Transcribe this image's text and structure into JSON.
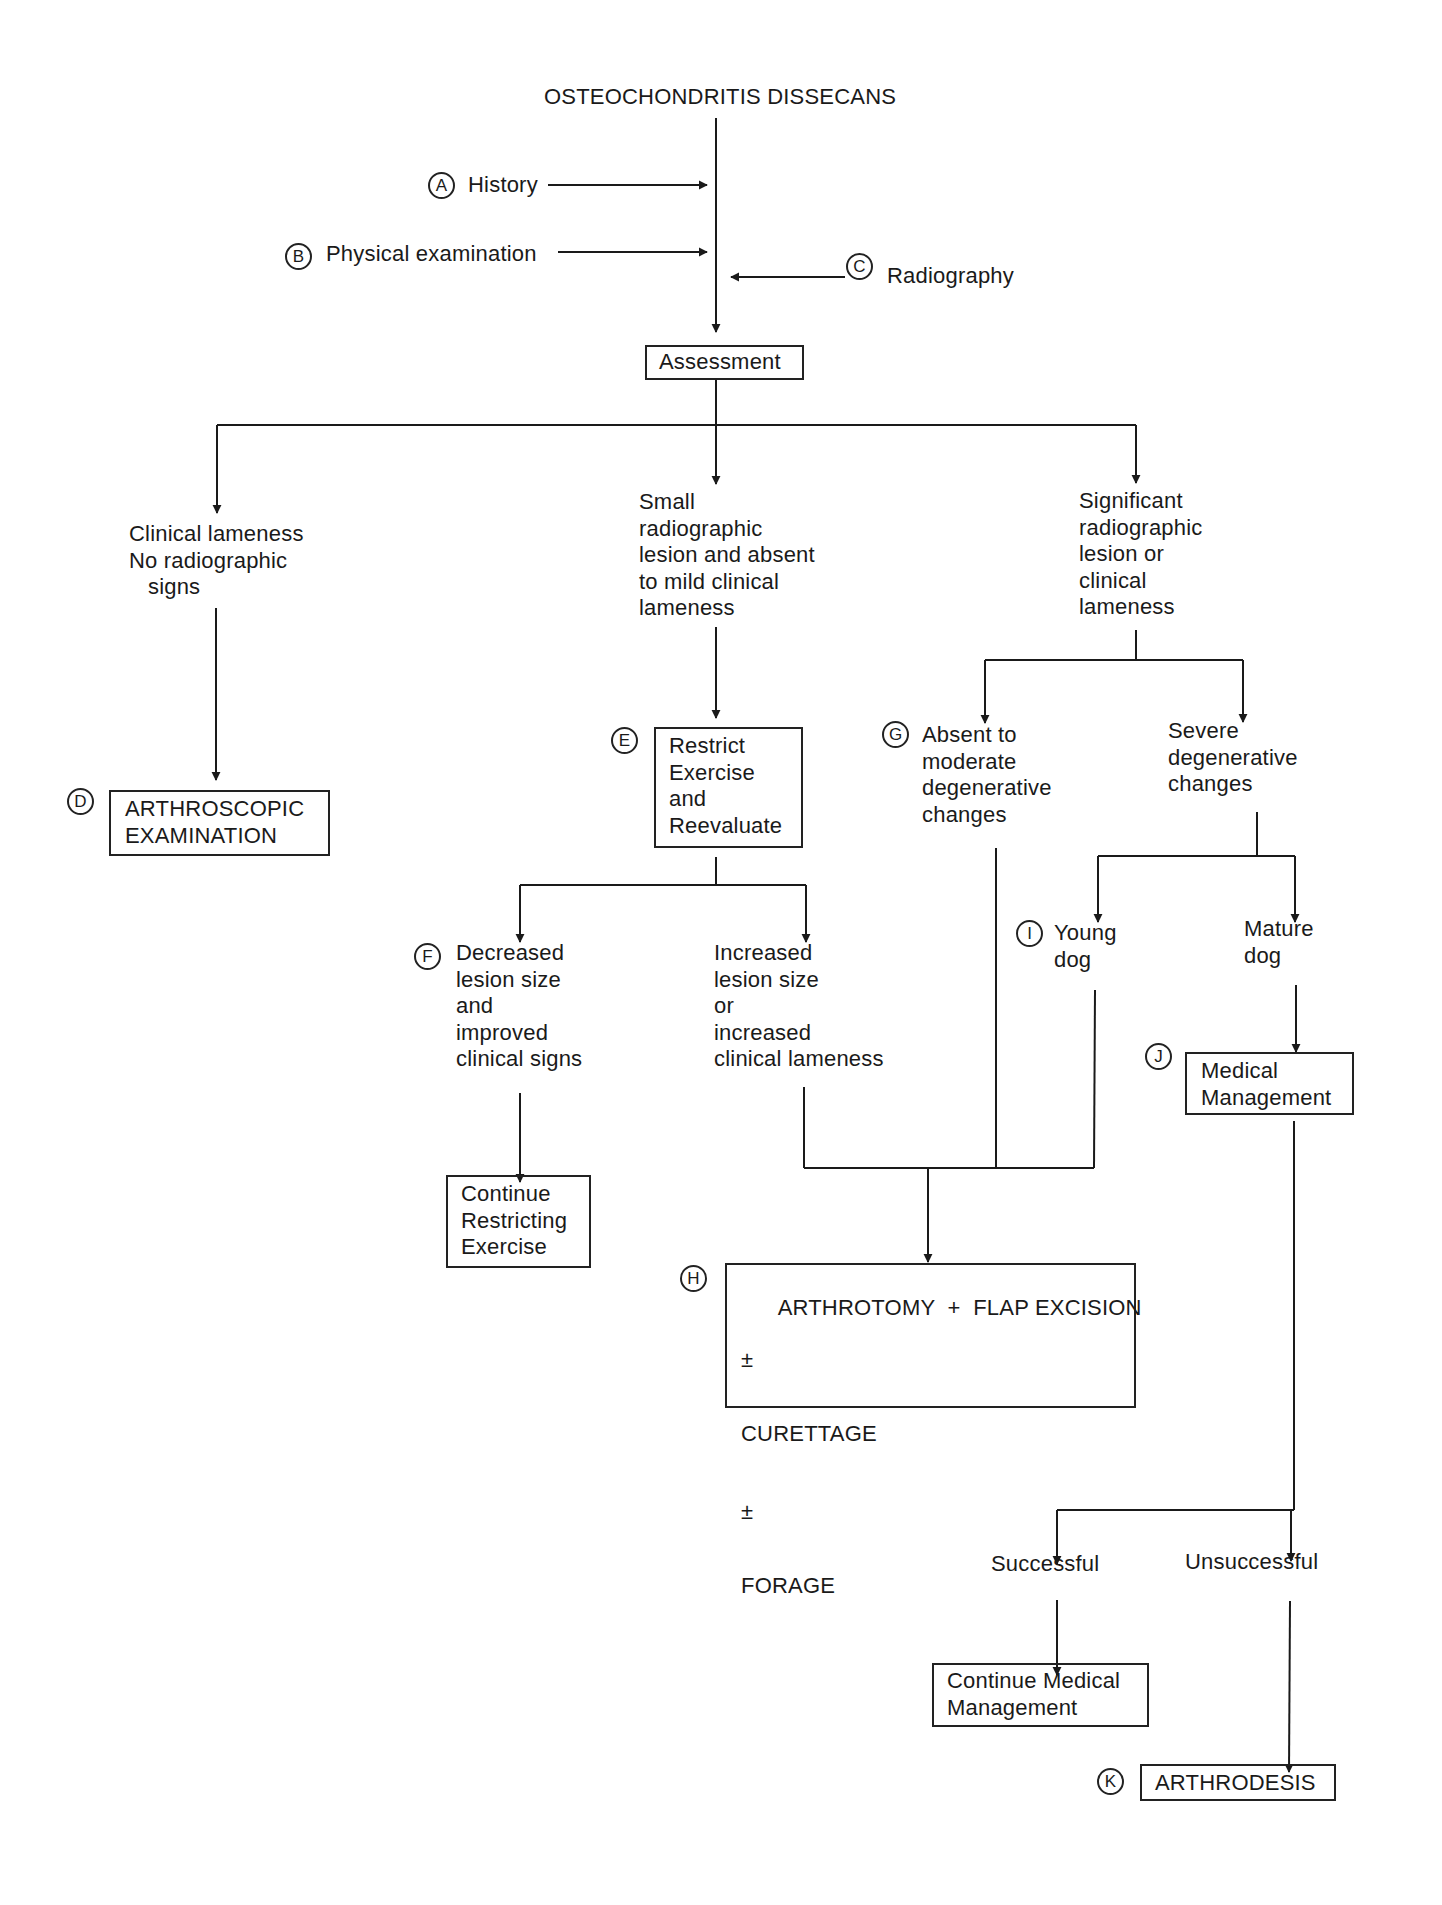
{
  "title": "OSTEOCHONDRITIS DISSECANS",
  "inputs": [
    {
      "marker": "A",
      "label": "History"
    },
    {
      "marker": "B",
      "label": "Physical examination"
    },
    {
      "marker": "C",
      "label": "Radiography"
    }
  ],
  "assessment": "Assessment",
  "branches": {
    "left": {
      "condition": "Clinical lameness\nNo radiographic\n   signs",
      "marker": "D",
      "action": "ARTHROSCOPIC\nEXAMINATION"
    },
    "middle": {
      "condition": "Small\nradiographic\nlesion and absent\nto mild clinical\nlameness",
      "marker": "E",
      "action": "Restrict\nExercise\nand\nReevaluate",
      "outcomes": {
        "decreased": {
          "marker": "F",
          "label": "Decreased\nlesion size\nand\nimproved\nclinical signs",
          "action": "Continue\nRestricting\nExercise"
        },
        "increased": {
          "label": "Increased\nlesion size\nor\nincreased\nclinical lameness"
        }
      }
    },
    "right": {
      "condition": "Significant\nradiographic\nlesion or\nclinical\nlameness",
      "absent_to_moderate": {
        "marker": "G",
        "label": "Absent to\nmoderate\ndegenerative\nchanges"
      },
      "severe": {
        "label": "Severe\ndegenerative\nchanges",
        "young": {
          "marker": "I",
          "label": "Young\ndog"
        },
        "mature": {
          "label": "Mature\ndog"
        }
      }
    }
  },
  "surgery": {
    "marker": "H",
    "line1": "ARTHROTOMY  +  FLAP EXCISION",
    "pm1": "±",
    "line2": "CURETTAGE",
    "pm2": "±",
    "line3": "FORAGE"
  },
  "medical": {
    "marker": "J",
    "label": "Medical\nManagement",
    "successful": "Successful",
    "unsuccessful": "Unsuccessful",
    "continue": "Continue Medical\nManagement",
    "final_marker": "K",
    "final": "ARTHRODESIS"
  },
  "colors": {
    "ink": "#1a1a1a",
    "background": "#ffffff"
  }
}
